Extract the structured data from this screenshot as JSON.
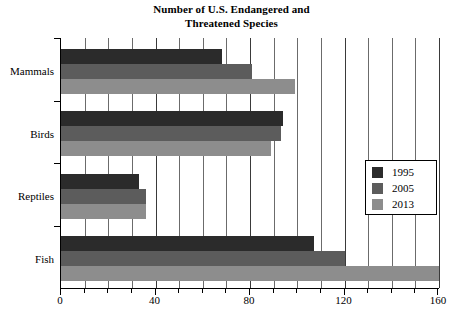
{
  "chart_data": {
    "type": "bar",
    "orientation": "horizontal",
    "title": "Number of U.S. Endangered and Threatened Species",
    "title_lines": [
      "Number of U.S. Endangered and",
      "Threatened Species"
    ],
    "categories": [
      "Mammals",
      "Birds",
      "Reptiles",
      "Fish"
    ],
    "series": [
      {
        "name": "1995",
        "color": "#2b2b2b",
        "values": [
          68,
          94,
          33,
          107
        ]
      },
      {
        "name": "2005",
        "color": "#5c5c5c",
        "values": [
          81,
          93,
          36,
          120
        ]
      },
      {
        "name": "2013",
        "color": "#8d8d8d",
        "values": [
          99,
          89,
          36,
          160
        ]
      }
    ],
    "xlabel": "",
    "ylabel": "",
    "xlim": [
      0,
      160
    ],
    "xticks": [
      0,
      40,
      80,
      120,
      160
    ],
    "xtick_labels": [
      "0",
      "40",
      "80",
      "120",
      "160"
    ],
    "xticks_minor_step": 10,
    "grid": true,
    "grid_axis": "x",
    "legend": {
      "position": "center-right",
      "entries": [
        "1995",
        "2005",
        "2013"
      ]
    }
  }
}
